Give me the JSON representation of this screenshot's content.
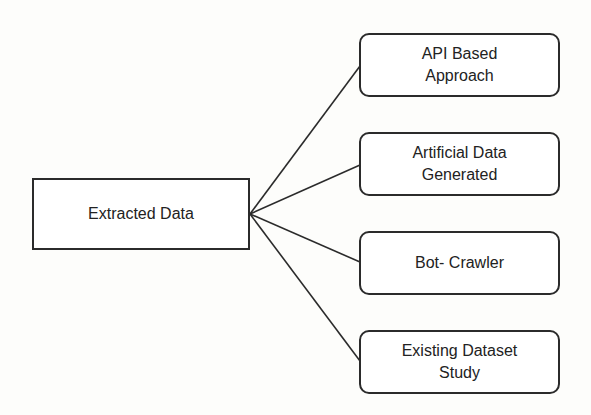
{
  "diagram": {
    "root": {
      "label": "Extracted Data"
    },
    "children": [
      {
        "label": "API Based\nApproach"
      },
      {
        "label": "Artificial Data\nGenerated"
      },
      {
        "label": "Bot- Crawler"
      },
      {
        "label": "Existing Dataset\nStudy"
      }
    ],
    "colors": {
      "stroke": "#2b2b2b",
      "background": "#fdfdfb"
    }
  }
}
